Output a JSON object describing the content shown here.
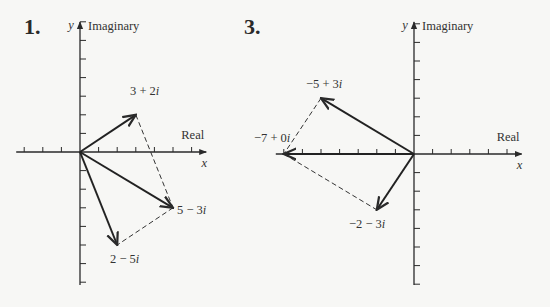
{
  "figures": [
    {
      "number": "1.",
      "y_axis_var": "y",
      "y_axis_label": "Imaginary",
      "x_axis_var": "x",
      "x_axis_label": "Real",
      "origin": [
        80,
        152
      ],
      "unit": 18.6,
      "x_range": [
        -3,
        7
      ],
      "y_range": [
        -7,
        7
      ],
      "vectors": [
        {
          "re": 3,
          "im": 2,
          "label": "3 + 2i",
          "style": "solid"
        },
        {
          "re": 5,
          "im": -3,
          "label": "5 − 3i",
          "style": "solid"
        },
        {
          "re": 2,
          "im": -5,
          "label": "2 − 5i",
          "style": "solid"
        }
      ],
      "dashed": [
        [
          [
            3,
            2
          ],
          [
            5,
            -3
          ]
        ],
        [
          [
            5,
            -3
          ],
          [
            2,
            -5
          ]
        ]
      ]
    },
    {
      "number": "3.",
      "y_axis_var": "y",
      "y_axis_label": "Imaginary",
      "x_axis_var": "x",
      "x_axis_label": "Real",
      "origin": [
        414,
        154
      ],
      "unit": 18.6,
      "x_range": [
        -7,
        6
      ],
      "y_range": [
        -7,
        7
      ],
      "vectors": [
        {
          "re": -5,
          "im": 3,
          "label": "−5 + 3i",
          "style": "solid"
        },
        {
          "re": -7,
          "im": 0,
          "label": "−7 + 0i",
          "style": "solid"
        },
        {
          "re": -2,
          "im": -3,
          "label": "−2 − 3i",
          "style": "solid"
        }
      ],
      "dashed": [
        [
          [
            -5,
            3
          ],
          [
            -7,
            0
          ]
        ],
        [
          [
            -7,
            0
          ],
          [
            -2,
            -3
          ]
        ]
      ]
    }
  ]
}
